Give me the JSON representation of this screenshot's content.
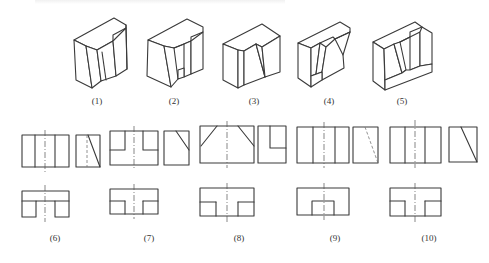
{
  "isometric_figures": [
    {
      "id": 1,
      "label": "(1)"
    },
    {
      "id": 2,
      "label": "(2)"
    },
    {
      "id": 3,
      "label": "(3)"
    },
    {
      "id": 4,
      "label": "(4)"
    },
    {
      "id": 5,
      "label": "(5)"
    }
  ],
  "orthographic_views": [
    {
      "id": 6,
      "label": "(6)"
    },
    {
      "id": 7,
      "label": "(7)"
    },
    {
      "id": 8,
      "label": "(8)"
    },
    {
      "id": 9,
      "label": "(9)"
    },
    {
      "id": 10,
      "label": "(10)"
    }
  ],
  "colors": {
    "line": "#3a3a3a",
    "background": "#ffffff"
  }
}
